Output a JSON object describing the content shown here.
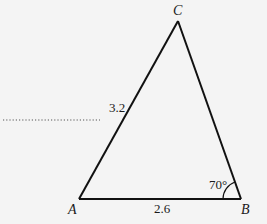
{
  "diagram": {
    "type": "triangle",
    "vertices": [
      {
        "label": "A",
        "x": 79,
        "y": 199
      },
      {
        "label": "B",
        "x": 241,
        "y": 199
      },
      {
        "label": "C",
        "x": 178,
        "y": 21
      }
    ],
    "sides": {
      "AC": {
        "label": "3.2"
      },
      "AB": {
        "label": "2.6"
      }
    },
    "angles": {
      "B": {
        "label": "70°"
      }
    },
    "colors": {
      "line": "#111111",
      "background": "#f4f4f4",
      "dotted": "#555555"
    }
  }
}
